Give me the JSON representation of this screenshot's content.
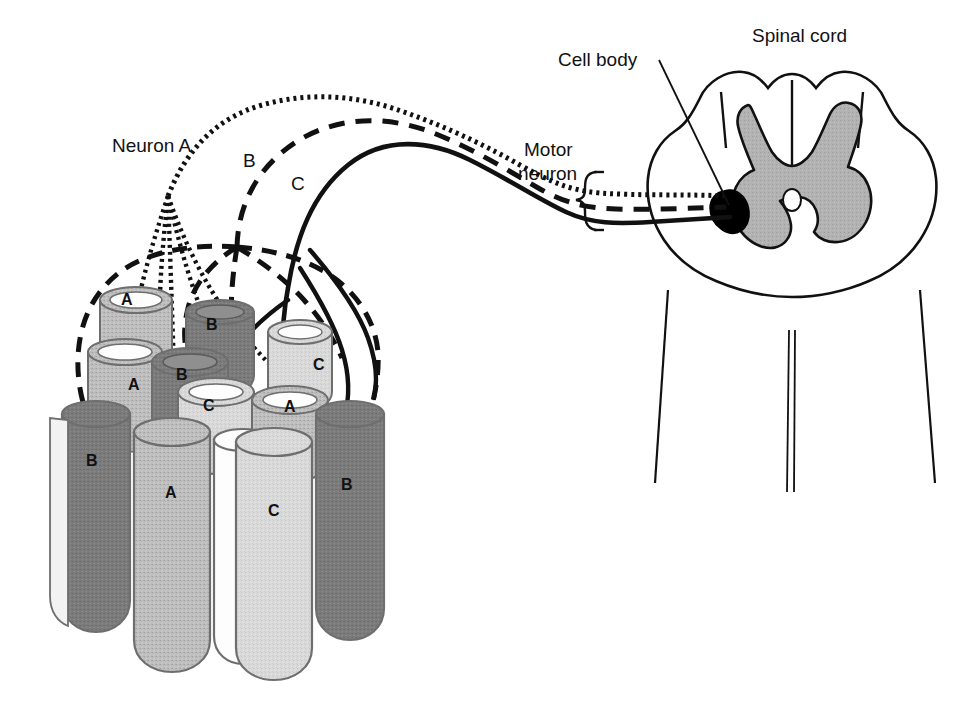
{
  "figure": {
    "background_color": "#ffffff"
  },
  "labels": {
    "neuron_a": "Neuron A",
    "neuron_b": "B",
    "neuron_c": "C",
    "cell_body": "Cell body",
    "motor_neuron_line1": "Motor",
    "motor_neuron_line2": "neuron",
    "spinal_cord": "Spinal cord"
  },
  "colors": {
    "outline": "#111111",
    "gray_matter": "#b0b0b0",
    "cell_body_fill": "#000000",
    "fiber_a": "#b9b9b9",
    "fiber_b": "#7c7c7c",
    "fiber_c": "#d9d9d9",
    "fiber_white": "#fdfdfd",
    "fiber_edge": "#6e6e6e",
    "background": "#ffffff"
  },
  "legend": {
    "line_styles": [
      {
        "neuron": "A",
        "style": "dotted",
        "description": "Neuron A axon drawn as a fine dotted line"
      },
      {
        "neuron": "B",
        "style": "dashed",
        "description": "Neuron B axon drawn as a long-dashed line"
      },
      {
        "neuron": "C",
        "style": "solid",
        "description": "Neuron C axon drawn as a solid line"
      }
    ]
  },
  "muscle_fibers": {
    "note": "Each cylinder is a muscle fiber labelled by the motor neuron that innervates it",
    "back_row": [
      {
        "id": "fiber-back-a1",
        "label": "A",
        "shade": "fiber_a"
      },
      {
        "id": "fiber-back-b1",
        "label": "B",
        "shade": "fiber_b"
      },
      {
        "id": "fiber-back-c1",
        "label": "C",
        "shade": "fiber_c"
      }
    ],
    "middle_row": [
      {
        "id": "fiber-mid-a2",
        "label": "A",
        "shade": "fiber_a"
      },
      {
        "id": "fiber-mid-b2",
        "label": "B",
        "shade": "fiber_b"
      },
      {
        "id": "fiber-mid-c2",
        "label": "C",
        "shade": "fiber_c"
      },
      {
        "id": "fiber-mid-a3",
        "label": "A",
        "shade": "fiber_a"
      }
    ],
    "front_row": [
      {
        "id": "fiber-front-b3",
        "label": "B",
        "shade": "fiber_b"
      },
      {
        "id": "fiber-front-a4",
        "label": "A",
        "shade": "fiber_a"
      },
      {
        "id": "fiber-front-white",
        "label": "",
        "shade": "fiber_white"
      },
      {
        "id": "fiber-front-c3",
        "label": "C",
        "shade": "fiber_c"
      },
      {
        "id": "fiber-front-b4",
        "label": "B",
        "shade": "fiber_b"
      }
    ]
  },
  "spinal_cord": {
    "structures": [
      "white matter outline",
      "butterfly-shaped gray matter",
      "dorsal horns",
      "ventral horns",
      "central canal",
      "ventral median fissure",
      "motor neuron cell body"
    ]
  },
  "bracket": {
    "name": "motor-neuron-bracket",
    "description": "curly brace grouping the three axons"
  }
}
